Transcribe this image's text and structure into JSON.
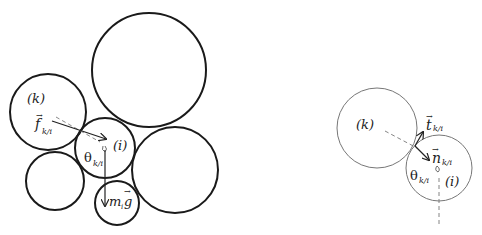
{
  "left_diagram": {
    "label_k": "(k)",
    "label_i": "(i)",
    "force_label": "f",
    "force_sub": "k/i",
    "theta_label": "θ",
    "theta_sub": "k/i",
    "gravity_label_m": "m",
    "gravity_label_sub": "i",
    "gravity_label_g": "g",
    "vector_arrow": "→"
  },
  "right_diagram": {
    "label_k": "(k)",
    "label_i": "(i)",
    "tangent_label": "t",
    "tangent_sub": "k/i",
    "normal_label": "n",
    "normal_sub": "k/i",
    "theta_label": "θ",
    "theta_sub": "k/i",
    "vector_arrow": "→"
  },
  "colors": {
    "thick_stroke": "#1a1a1a",
    "thin_stroke": "#777777",
    "dash": "#888888"
  }
}
